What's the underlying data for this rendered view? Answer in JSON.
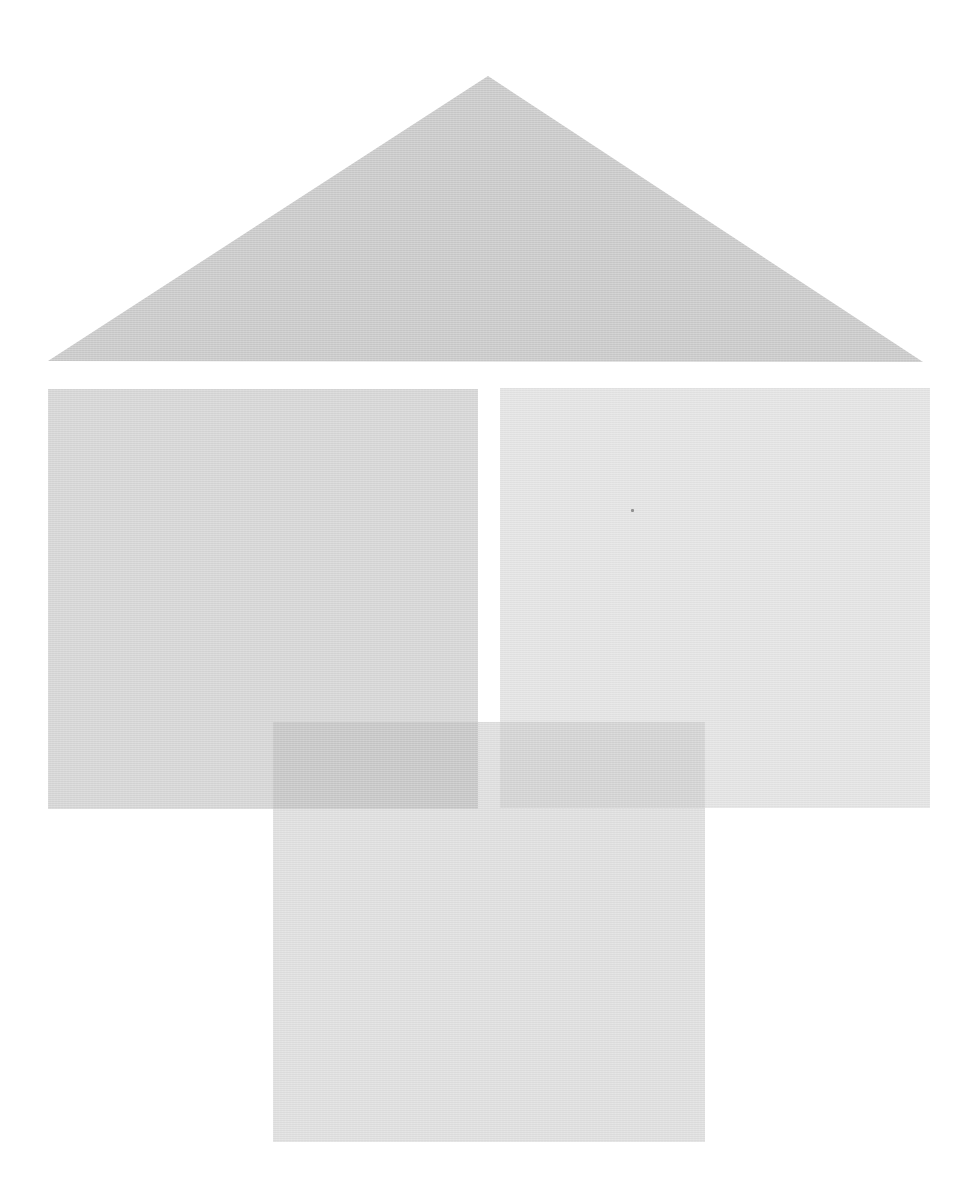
{
  "canvas": {
    "width": 970,
    "height": 1178,
    "background_color": "#ffffff"
  },
  "shapes": {
    "roof-triangle": {
      "type": "polygon",
      "points": [
        [
          488,
          76
        ],
        [
          923,
          362
        ],
        [
          48,
          361
        ]
      ],
      "color": "#c9c9c9"
    },
    "left-square": {
      "type": "rect",
      "x": 48,
      "y": 389,
      "w": 430,
      "h": 420,
      "color": "#d5d5d5"
    },
    "right-square": {
      "type": "rect",
      "x": 500,
      "y": 388,
      "w": 430,
      "h": 420,
      "color": "#e3e3e3"
    },
    "bottom-square": {
      "type": "rect",
      "x": 273,
      "y": 722,
      "w": 432,
      "h": 420,
      "color": "#dedede"
    },
    "bottom-left-overlap": {
      "type": "rect",
      "x": 273,
      "y": 722,
      "w": 205,
      "h": 87,
      "color": "#c6c6c6"
    },
    "bottom-right-overlap": {
      "type": "rect",
      "x": 500,
      "y": 722,
      "w": 205,
      "h": 86,
      "color": "#d2d2d2"
    },
    "dust-speck": {
      "type": "rect",
      "x": 631,
      "y": 509,
      "w": 3,
      "h": 3,
      "color": "#909090"
    }
  }
}
